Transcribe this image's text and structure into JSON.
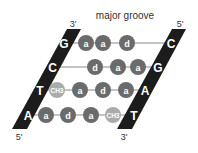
{
  "title": "major groove",
  "colors": {
    "strand": "#1c1c1c",
    "base_letter": "#ffffff",
    "atom_dark": "#6b6b6b",
    "atom_light": "#ababab",
    "bond_line": "#8a8a8a",
    "label": "#333333"
  },
  "strands": {
    "left": {
      "top_label": "3'",
      "bottom_label": "5'"
    },
    "right": {
      "top_label": "5'",
      "bottom_label": "3'"
    }
  },
  "base_pairs": [
    {
      "left_base": "G",
      "right_base": "C",
      "groups": [
        "a",
        "a",
        "d"
      ]
    },
    {
      "left_base": "C",
      "right_base": "G",
      "groups": [
        "d",
        "a",
        "a"
      ]
    },
    {
      "left_base": "T",
      "right_base": "A",
      "groups": [
        "CH3",
        "a",
        "d",
        "a"
      ]
    },
    {
      "left_base": "A",
      "right_base": "T",
      "groups": [
        "a",
        "d",
        "a",
        "CH3"
      ]
    }
  ]
}
